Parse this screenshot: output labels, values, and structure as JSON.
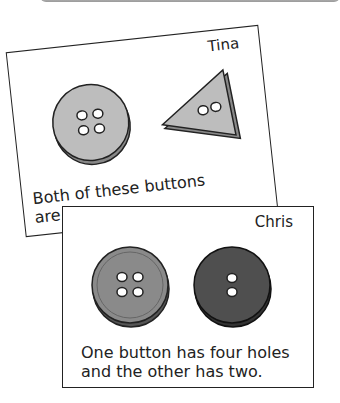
{
  "cards": [
    {
      "name": "Tina",
      "caption_line1": "Both of these buttons",
      "caption_line2": "are green.",
      "buttons": [
        {
          "shape": "circle",
          "holes": 4,
          "color": "#bdbdbd"
        },
        {
          "shape": "triangle",
          "holes": 2,
          "color": "#bdbdbd"
        }
      ]
    },
    {
      "name": "Chris",
      "caption_line1": "One button has four holes",
      "caption_line2": "and the other has two.",
      "buttons": [
        {
          "shape": "circle",
          "holes": 4,
          "color": "#8a8a8a"
        },
        {
          "shape": "circle",
          "holes": 2,
          "color": "#4f4f4f"
        }
      ]
    }
  ]
}
